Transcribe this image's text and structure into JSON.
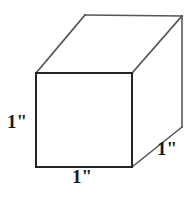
{
  "figure": {
    "type": "geometry-diagram",
    "shape": "cube",
    "background_color": "#ffffff",
    "line_color": "#3a3a45",
    "line_color_front": "#2a2a2a",
    "label_color": "#1a1a1a",
    "canvas": {
      "width": 194,
      "height": 199
    }
  },
  "labels": {
    "height": "1\"",
    "width": "1\"",
    "depth": "1\""
  },
  "geometry": {
    "front_face": {
      "top_left": [
        36,
        73
      ],
      "top_right": [
        132,
        73
      ],
      "bottom_right": [
        132,
        167
      ],
      "bottom_left": [
        36,
        167
      ]
    },
    "back_face": {
      "top_left": [
        85,
        15
      ],
      "top_right": [
        182,
        16
      ],
      "bottom_right": [
        182,
        127
      ]
    },
    "edges": [
      {
        "name": "front-top",
        "from": [
          36,
          73
        ],
        "to": [
          132,
          73
        ]
      },
      {
        "name": "front-right",
        "from": [
          132,
          73
        ],
        "to": [
          132,
          167
        ]
      },
      {
        "name": "front-bottom",
        "from": [
          132,
          167
        ],
        "to": [
          36,
          167
        ]
      },
      {
        "name": "front-left",
        "from": [
          36,
          167
        ],
        "to": [
          36,
          73
        ]
      },
      {
        "name": "top-left-diagonal",
        "from": [
          36,
          73
        ],
        "to": [
          85,
          15
        ]
      },
      {
        "name": "back-top",
        "from": [
          85,
          15
        ],
        "to": [
          182,
          16
        ]
      },
      {
        "name": "top-right-diagonal",
        "from": [
          132,
          73
        ],
        "to": [
          182,
          16
        ]
      },
      {
        "name": "back-right-vertical",
        "from": [
          182,
          16
        ],
        "to": [
          182,
          127
        ]
      },
      {
        "name": "bottom-right-diagonal",
        "from": [
          132,
          167
        ],
        "to": [
          182,
          127
        ]
      }
    ]
  }
}
